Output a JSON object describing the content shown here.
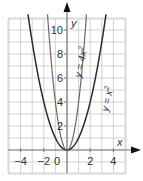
{
  "chart_data": {
    "type": "line",
    "title": "",
    "xlabel": "x",
    "ylabel": "y",
    "xlim": [
      -5,
      5
    ],
    "ylim": [
      -2,
      11
    ],
    "grid": true,
    "grid_step": 1,
    "x_ticks": [
      -4,
      -2,
      0,
      2,
      4
    ],
    "x_tick_labels": [
      "−4",
      "−2",
      "0",
      "2",
      "4"
    ],
    "y_ticks": [
      2,
      4,
      6,
      8,
      10
    ],
    "y_tick_labels": [
      "2",
      "4",
      "6",
      "8",
      "10"
    ],
    "series": [
      {
        "name": "y = x²",
        "label": "y = x",
        "label_exp": "2",
        "formula": "x^2",
        "color": "#2b2b2b",
        "x": [
          -3.3,
          -3,
          -2,
          -1,
          0,
          1,
          2,
          3,
          3.3
        ],
        "values": [
          10.89,
          9,
          4,
          1,
          0,
          1,
          4,
          9,
          10.89
        ]
      },
      {
        "name": "y = 4x²",
        "label": "y = 4x",
        "label_exp": "2",
        "formula": "4x^2",
        "color": "#6a6a6a",
        "x": [
          -1.65,
          -1.5,
          -1,
          -0.5,
          0,
          0.5,
          1,
          1.5,
          1.65
        ],
        "values": [
          10.89,
          9,
          4,
          1,
          0,
          1,
          4,
          9,
          10.89
        ]
      }
    ],
    "annotations": [
      "y = 4x²",
      "y = x²"
    ]
  },
  "colors": {
    "grid": "#c8c8c8",
    "axis": "#7a7a7a",
    "arrow": "#111111",
    "text": "#333333"
  }
}
